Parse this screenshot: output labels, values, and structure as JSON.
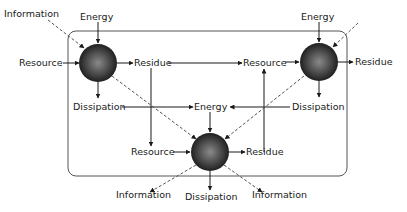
{
  "diagram": {
    "node1": {
      "inputs": {
        "information": "Information",
        "energy": "Energy",
        "resource": "Resource"
      },
      "outputs": {
        "residue": "Residue",
        "dissipation": "Dissipation"
      }
    },
    "node2": {
      "inputs": {
        "energy": "Energy",
        "resource": "Resource"
      },
      "outputs": {
        "residue": "Residue",
        "dissipation": "Dissipation"
      }
    },
    "node3": {
      "inputs": {
        "energy": "Energy",
        "resource": "Resource"
      },
      "outputs": {
        "residue": "Residue",
        "dissipation": "Dissipation",
        "information_left": "Information",
        "information_right": "Information"
      }
    }
  },
  "colors": {
    "line": "#1a1a1a",
    "box": "#555555",
    "sphere_dark": "#1c1c1c",
    "sphere_light": "#8a8a8a"
  }
}
